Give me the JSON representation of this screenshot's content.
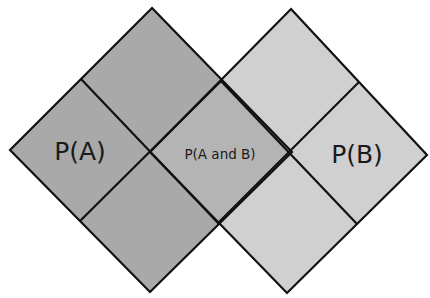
{
  "diagram": {
    "type": "probability-overlap-diamond",
    "labels": {
      "event_a": "P(A)",
      "intersection": "P(A and B)",
      "event_b": "P(B)"
    },
    "colors": {
      "event_a_fill": "#a9a9a9",
      "event_b_fill": "#d0d0d0",
      "intersection_fill": "#b4b4b4",
      "stroke": "#111111",
      "background": "#ffffff"
    },
    "shapes": {
      "event_a": {
        "top": [
          152,
          8
        ],
        "left": [
          10,
          150
        ],
        "bottom": [
          150,
          292
        ],
        "right": [
          292,
          152
        ],
        "center": [
          150,
          153
        ]
      },
      "event_b": {
        "top": [
          291,
          9
        ],
        "left": [
          150,
          152
        ],
        "bottom": [
          287,
          293
        ],
        "right": [
          427,
          155
        ],
        "center": [
          288,
          156
        ]
      }
    }
  }
}
